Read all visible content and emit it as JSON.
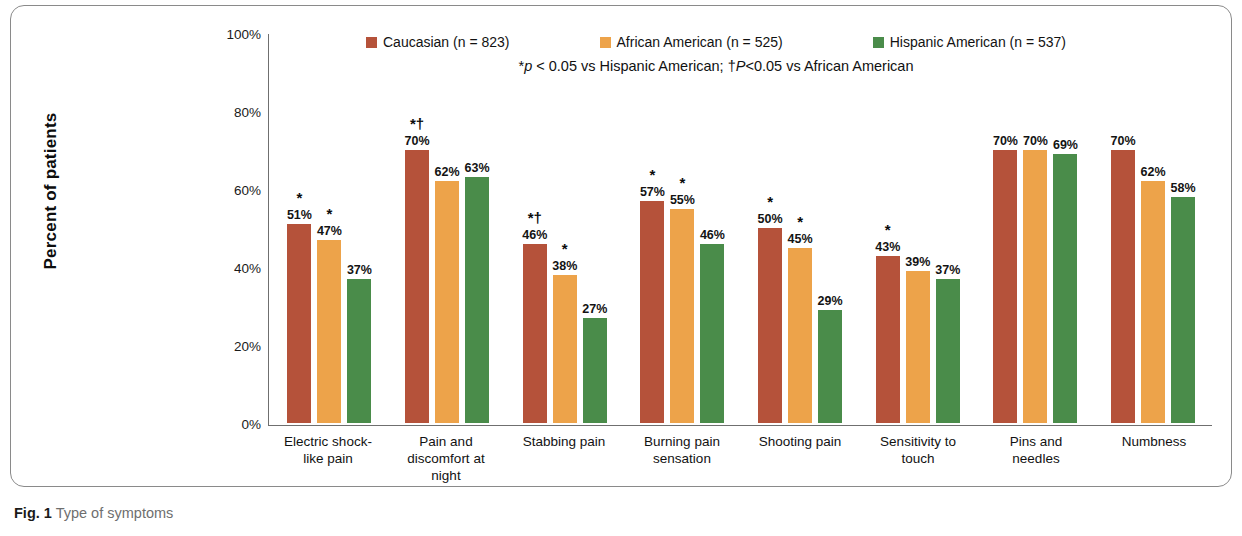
{
  "caption": {
    "label": "Fig. 1",
    "text": "Type of symptoms"
  },
  "colors": {
    "caucasian": "#b5523a",
    "african_american": "#eda34a",
    "hispanic_american": "#4a8c4a",
    "axis": "#6f6f6f",
    "panel_border": "#8a8a8a"
  },
  "footnote": {
    "part1_italic": "p",
    "part1_rest": " < 0.05 vs Hispanic American; ",
    "dagger": "†",
    "part2_italic": "P",
    "part2_rest": "<0.05 vs African American",
    "asterisk": "*",
    "full": "*p < 0.05 vs Hispanic American; †P<0.05 vs African American"
  },
  "chart_data": {
    "type": "bar",
    "title": "Type of symptoms",
    "xlabel": "",
    "ylabel": "Percent of patients",
    "ylim": [
      0,
      100
    ],
    "yticks": [
      "0%",
      "20%",
      "40%",
      "60%",
      "80%",
      "100%"
    ],
    "ytick_values": [
      0,
      20,
      40,
      60,
      80,
      100
    ],
    "grid": false,
    "legend_position": "top",
    "categories": [
      "Electric shock-like pain",
      "Pain and discomfort at night",
      "Stabbing pain",
      "Burning pain sensation",
      "Shooting pain",
      "Sensitivity to touch",
      "Pins and needles",
      "Numbness"
    ],
    "category_lines": [
      [
        "Electric shock-",
        "like pain"
      ],
      [
        "Pain and",
        "discomfort at",
        "night"
      ],
      [
        "Stabbing pain"
      ],
      [
        "Burning pain",
        "sensation"
      ],
      [
        "Shooting pain"
      ],
      [
        "Sensitivity to",
        "touch"
      ],
      [
        "Pins and",
        "needles"
      ],
      [
        "Numbness"
      ]
    ],
    "series": [
      {
        "name": "Caucasian (n = 823)",
        "short": "Caucasian",
        "n": 823,
        "color": "#b5523a",
        "values": [
          51,
          70,
          46,
          57,
          50,
          43,
          70,
          70
        ],
        "labels": [
          "51%",
          "70%",
          "46%",
          "57%",
          "50%",
          "43%",
          "70%",
          "70%"
        ],
        "sig": [
          "*",
          "*†",
          "*†",
          "*",
          "*",
          "*",
          "",
          ""
        ]
      },
      {
        "name": "African American (n = 525)",
        "short": "African American",
        "n": 525,
        "color": "#eda34a",
        "values": [
          47,
          62,
          38,
          55,
          45,
          39,
          70,
          62
        ],
        "labels": [
          "47%",
          "62%",
          "38%",
          "55%",
          "45%",
          "39%",
          "70%",
          "62%"
        ],
        "sig": [
          "*",
          "",
          "*",
          "*",
          "*",
          "",
          "",
          ""
        ]
      },
      {
        "name": "Hispanic American (n = 537)",
        "short": "Hispanic American",
        "n": 537,
        "color": "#4a8c4a",
        "values": [
          37,
          63,
          27,
          46,
          29,
          37,
          69,
          58
        ],
        "labels": [
          "37%",
          "63%",
          "27%",
          "46%",
          "29%",
          "37%",
          "69%",
          "58%"
        ],
        "sig": [
          "",
          "",
          "",
          "",
          "",
          "",
          "",
          ""
        ]
      }
    ]
  }
}
